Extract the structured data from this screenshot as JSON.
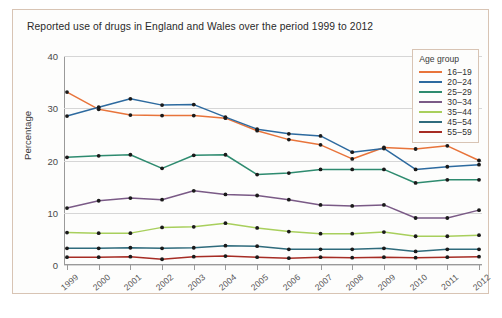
{
  "figure": {
    "title": "Reported use of drugs in England and Wales over the period 1999 to 2012",
    "border_color": "#d8c4b4",
    "background_color": "#fdfdfc"
  },
  "legend": {
    "title": "Age group"
  },
  "chart_data": {
    "type": "line",
    "title": "Reported use of drugs in England and Wales over the period 1999 to 2012",
    "xlabel": "",
    "ylabel": "Percentage",
    "categories": [
      "1999",
      "2000",
      "2001",
      "2002",
      "2003",
      "2004",
      "2005",
      "2006",
      "2007",
      "2008",
      "2009",
      "2010",
      "2011",
      "2012"
    ],
    "x": [
      1999,
      2000,
      2001,
      2002,
      2003,
      2004,
      2005,
      2006,
      2007,
      2008,
      2009,
      2010,
      2011,
      2012
    ],
    "ylim": [
      0,
      40
    ],
    "yticks": [
      0,
      10,
      20,
      30,
      40
    ],
    "ytick_labels": [
      "0",
      "10",
      "20",
      "30",
      "40"
    ],
    "grid": true,
    "legend_position": "upper right",
    "legend_title": "Age group",
    "series": [
      {
        "name": "16–19",
        "color": "#e8743b",
        "values": [
          33.1,
          29.8,
          28.7,
          28.6,
          28.6,
          28.1,
          25.7,
          24.0,
          23.0,
          20.3,
          22.5,
          22.2,
          22.8,
          20.0
        ]
      },
      {
        "name": "20–24",
        "color": "#2d6a9f",
        "values": [
          28.5,
          30.2,
          31.8,
          30.6,
          30.7,
          28.3,
          26.0,
          25.1,
          24.7,
          21.6,
          22.3,
          18.3,
          18.8,
          19.2
        ]
      },
      {
        "name": "25–29",
        "color": "#2e8b6f",
        "values": [
          20.6,
          20.9,
          21.1,
          18.5,
          21.0,
          21.1,
          17.3,
          17.6,
          18.3,
          18.3,
          18.3,
          15.7,
          16.3,
          16.3
        ]
      },
      {
        "name": "30–34",
        "color": "#7a5a86",
        "values": [
          10.9,
          12.3,
          12.8,
          12.5,
          14.2,
          13.5,
          13.3,
          12.5,
          11.5,
          11.3,
          11.5,
          9.0,
          9.0,
          10.5
        ]
      },
      {
        "name": "35–44",
        "color": "#a8cf5c",
        "values": [
          6.2,
          6.1,
          6.1,
          7.2,
          7.3,
          8.0,
          7.1,
          6.4,
          6.0,
          6.0,
          6.3,
          5.5,
          5.5,
          5.7
        ]
      },
      {
        "name": "45–54",
        "color": "#2f6b7c",
        "values": [
          3.2,
          3.2,
          3.3,
          3.2,
          3.3,
          3.7,
          3.6,
          3.0,
          3.0,
          3.0,
          3.2,
          2.6,
          3.0,
          3.0
        ]
      },
      {
        "name": "55–59",
        "color": "#a62c24",
        "values": [
          1.5,
          1.5,
          1.6,
          1.1,
          1.6,
          1.7,
          1.5,
          1.3,
          1.5,
          1.4,
          1.5,
          1.4,
          1.5,
          1.6
        ]
      }
    ]
  }
}
